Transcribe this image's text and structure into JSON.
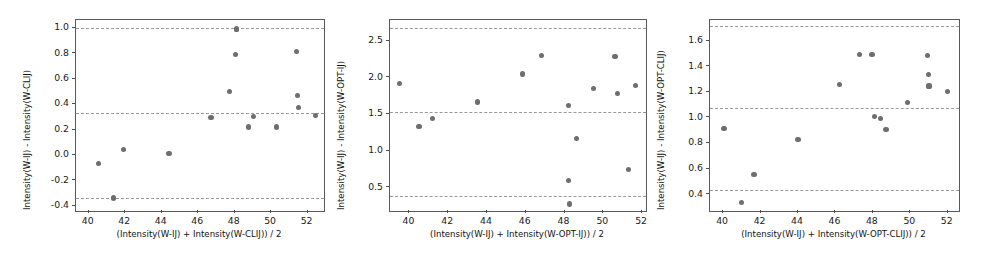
{
  "figure": {
    "type": "bland-altman-multi-panel",
    "width": 990,
    "height": 261,
    "background": "#ffffff",
    "marker_color": "#6e6e6e",
    "limit_line_color": "#9a9a9a",
    "axis_color": "#5a5a5a"
  },
  "chart_data": [
    {
      "type": "scatter",
      "panel": 1,
      "title": "",
      "xlabel": "(Intensity(W-IJ) + Intensity(W-CLIJ)) / 2",
      "ylabel": "Intensity(W-IJ) - Intensity(W-CLIJ)",
      "xlim": [
        39.3,
        52.9
      ],
      "ylim": [
        -0.44,
        1.06
      ],
      "xticks": [
        40,
        42,
        44,
        46,
        48,
        50,
        52
      ],
      "xticklabels": [
        "40",
        "42",
        "44",
        "46",
        "48",
        "50",
        "52"
      ],
      "yticks": [
        -0.4,
        -0.2,
        0.0,
        0.2,
        0.4,
        0.6,
        0.8,
        1.0
      ],
      "yticklabels": [
        "-0.4",
        "-0.2",
        "0.0",
        "0.2",
        "0.4",
        "0.6",
        "0.8",
        "1.0"
      ],
      "grid": false,
      "legend": null,
      "reference_lines": [
        {
          "name": "upper-limit-of-agreement",
          "y": 0.995,
          "style": "dashed"
        },
        {
          "name": "mean-bias",
          "y": 0.328,
          "style": "dashed"
        },
        {
          "name": "lower-limit-of-agreement",
          "y": -0.341,
          "style": "dashed"
        }
      ],
      "x": [
        40.55,
        41.35,
        41.35,
        41.9,
        44.4,
        46.7,
        47.7,
        48.05,
        48.1,
        48.1,
        48.75,
        49.05,
        50.3,
        51.4,
        51.45,
        51.5,
        52.45
      ],
      "y": [
        -0.065,
        -0.34,
        -0.335,
        0.04,
        0.01,
        0.295,
        0.5,
        0.79,
        0.99,
        0.985,
        0.22,
        0.3,
        0.22,
        0.815,
        0.47,
        0.375,
        0.31
      ]
    },
    {
      "type": "scatter",
      "panel": 2,
      "title": "",
      "xlabel": "(Intensity(W-IJ) + Intensity(W-OPT-IJ)) / 2",
      "ylabel": "Intensity(W-IJ) - Intensity(W-OPT-IJ)",
      "xlim": [
        39.0,
        52.2
      ],
      "ylim": [
        0.18,
        2.78
      ],
      "xticks": [
        40,
        42,
        44,
        46,
        48,
        50,
        52
      ],
      "xticklabels": [
        "40",
        "42",
        "44",
        "46",
        "48",
        "50",
        "52"
      ],
      "yticks": [
        0.5,
        1.0,
        1.5,
        2.0,
        2.5
      ],
      "yticklabels": [
        "0.5",
        "1.0",
        "1.5",
        "2.0",
        "2.5"
      ],
      "grid": false,
      "legend": null,
      "reference_lines": [
        {
          "name": "upper-limit-of-agreement",
          "y": 2.675,
          "style": "dashed"
        },
        {
          "name": "mean-bias",
          "y": 1.525,
          "style": "dashed"
        },
        {
          "name": "lower-limit-of-agreement",
          "y": 0.385,
          "style": "dashed"
        }
      ],
      "x": [
        39.5,
        40.5,
        41.2,
        43.5,
        45.85,
        46.8,
        48.2,
        48.2,
        48.25,
        48.6,
        49.5,
        50.6,
        50.75,
        51.3,
        51.65
      ],
      "y": [
        1.92,
        1.335,
        1.435,
        1.665,
        2.045,
        2.3,
        1.615,
        0.59,
        0.275,
        1.165,
        1.85,
        2.285,
        1.78,
        0.745,
        1.885
      ]
    },
    {
      "type": "scatter",
      "panel": 3,
      "title": "",
      "xlabel": "(Intensity(W-IJ) + Intensity(W-OPT-CLIJ)) / 2",
      "ylabel": "Intensity(W-IJ) - Intensity(W-OPT-CLIJ)",
      "xlim": [
        39.3,
        52.6
      ],
      "ylim": [
        0.27,
        1.76
      ],
      "xticks": [
        40,
        42,
        44,
        46,
        48,
        50,
        52
      ],
      "xticklabels": [
        "40",
        "42",
        "44",
        "46",
        "48",
        "50",
        "52"
      ],
      "yticks": [
        0.4,
        0.6,
        0.8,
        1.0,
        1.2,
        1.4,
        1.6
      ],
      "yticklabels": [
        "0.4",
        "0.6",
        "0.8",
        "1.0",
        "1.2",
        "1.4",
        "1.6"
      ],
      "grid": false,
      "legend": null,
      "reference_lines": [
        {
          "name": "upper-limit-of-agreement",
          "y": 1.715,
          "style": "dashed"
        },
        {
          "name": "mean-bias",
          "y": 1.075,
          "style": "dashed"
        },
        {
          "name": "lower-limit-of-agreement",
          "y": 0.43,
          "style": "dashed"
        }
      ],
      "x": [
        40.05,
        41.0,
        41.65,
        44.0,
        46.2,
        47.3,
        47.95,
        48.1,
        48.4,
        48.7,
        49.85,
        50.9,
        50.95,
        51.0,
        52.0
      ],
      "y": [
        0.915,
        0.335,
        0.555,
        0.825,
        1.255,
        1.49,
        1.49,
        1.005,
        0.99,
        0.905,
        1.115,
        1.485,
        1.335,
        1.245,
        1.2
      ]
    }
  ]
}
